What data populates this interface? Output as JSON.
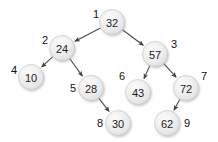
{
  "diagram": {
    "type": "binary-search-tree",
    "title": "",
    "node_fill": "#ececec",
    "node_stroke": "#c9c9c9",
    "edge_color": "#4a4a4a",
    "label_color": "#111111",
    "background": "#ffffff",
    "nodes": [
      {
        "id": "n1",
        "value": "32",
        "index": "1",
        "cx": 112,
        "cy": 22,
        "r": 12.5,
        "label_x": 93,
        "label_y": 14,
        "label_anchor": "start"
      },
      {
        "id": "n2",
        "value": "24",
        "index": "2",
        "cx": 62,
        "cy": 48,
        "r": 12.5,
        "label_x": 42,
        "label_y": 40,
        "label_anchor": "start"
      },
      {
        "id": "n3",
        "value": "57",
        "index": "3",
        "cx": 155,
        "cy": 54,
        "r": 12.5,
        "label_x": 171,
        "label_y": 44,
        "label_anchor": "start"
      },
      {
        "id": "n4",
        "value": "10",
        "index": "4",
        "cx": 31,
        "cy": 77,
        "r": 12.5,
        "label_x": 11,
        "label_y": 70,
        "label_anchor": "start"
      },
      {
        "id": "n5",
        "value": "28",
        "index": "5",
        "cx": 91,
        "cy": 88,
        "r": 12.5,
        "label_x": 70,
        "label_y": 88,
        "label_anchor": "start"
      },
      {
        "id": "n6",
        "value": "43",
        "index": "6",
        "cx": 138,
        "cy": 92,
        "r": 12.5,
        "label_x": 119,
        "label_y": 76,
        "label_anchor": "start"
      },
      {
        "id": "n7",
        "value": "72",
        "index": "7",
        "cx": 186,
        "cy": 88,
        "r": 12.5,
        "label_x": 201,
        "label_y": 76,
        "label_anchor": "start"
      },
      {
        "id": "n8",
        "value": "30",
        "index": "8",
        "cx": 118,
        "cy": 123,
        "r": 12.5,
        "label_x": 97,
        "label_y": 123,
        "label_anchor": "start"
      },
      {
        "id": "n9",
        "value": "62",
        "index": "9",
        "cx": 167,
        "cy": 123,
        "r": 12.5,
        "label_x": 184,
        "label_y": 123,
        "label_anchor": "start"
      }
    ],
    "edges": [
      {
        "id": "e1",
        "from": "n1",
        "to": "n2",
        "from_value": "32",
        "to_value": "24",
        "side": "left"
      },
      {
        "id": "e2",
        "from": "n1",
        "to": "n3",
        "from_value": "32",
        "to_value": "57",
        "side": "right"
      },
      {
        "id": "e3",
        "from": "n2",
        "to": "n4",
        "from_value": "24",
        "to_value": "10",
        "side": "left"
      },
      {
        "id": "e4",
        "from": "n2",
        "to": "n5",
        "from_value": "24",
        "to_value": "28",
        "side": "right"
      },
      {
        "id": "e5",
        "from": "n3",
        "to": "n6",
        "from_value": "57",
        "to_value": "43",
        "side": "left"
      },
      {
        "id": "e6",
        "from": "n3",
        "to": "n7",
        "from_value": "57",
        "to_value": "72",
        "side": "right"
      },
      {
        "id": "e7",
        "from": "n5",
        "to": "n8",
        "from_value": "28",
        "to_value": "30",
        "side": "right"
      },
      {
        "id": "e8",
        "from": "n7",
        "to": "n9",
        "from_value": "72",
        "to_value": "62",
        "side": "left"
      }
    ]
  }
}
